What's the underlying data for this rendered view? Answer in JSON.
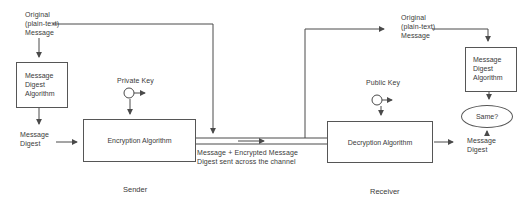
{
  "sender": {
    "original_message": "Original\n(plain-text)\nMessage",
    "digest_algorithm_box": "Message\nDigest\nAlgorithm",
    "message_digest_label": "Message\nDigest",
    "encryption_box": "Encryption Algorithm",
    "private_key_label": "Private Key",
    "role_label": "Sender"
  },
  "channel": {
    "caption": "Message + Encrypted Message\nDigest sent across the channel"
  },
  "receiver": {
    "original_message": "Original\n(plain-text)\nMessage",
    "decryption_box": "Decryption Algorithm",
    "public_key_label": "Public Key",
    "digest_algorithm_box": "Message\nDigest\nAlgorithm",
    "message_digest_label": "Message\nDigest",
    "compare_label": "Same?",
    "role_label": "Receiver"
  },
  "colors": {
    "line": "#4a4a4a",
    "text": "#3a3a3a",
    "background": "#ffffff"
  }
}
